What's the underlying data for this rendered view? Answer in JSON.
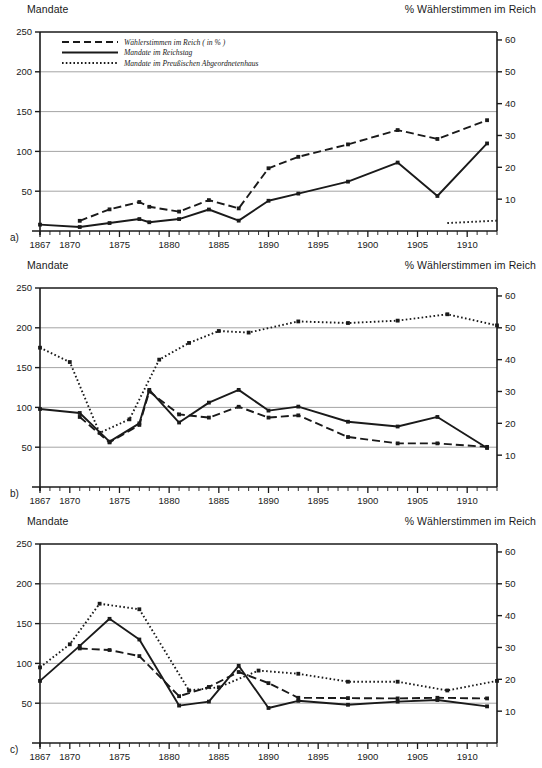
{
  "figure": {
    "axis_title_left": "Mandate",
    "axis_title_right": "% Wählerstimmen im Reich",
    "percent_symbol": "%",
    "panel_labels": [
      "a)",
      "b)",
      "c)"
    ]
  },
  "legend": {
    "position": "top-left of panel a",
    "items": [
      {
        "label": "Wählerstimmen im Reich ( in % )",
        "style": "dashed",
        "key": "votes"
      },
      {
        "label": "Mandate im Reichstag",
        "style": "solid",
        "key": "reichstag"
      },
      {
        "label": "Mandate im Preußischen Abgeordnetenhaus",
        "style": "dotted",
        "key": "preussen"
      }
    ]
  },
  "axes": {
    "left_ticks": [
      250,
      200,
      150,
      100,
      50
    ],
    "left_label_all": [
      0,
      50,
      100,
      150,
      200,
      250
    ],
    "right_ticks": [
      60,
      50,
      40,
      30,
      20,
      10
    ],
    "x_ticks": [
      1867,
      1870,
      1875,
      1880,
      1885,
      1890,
      1895,
      1900,
      1905,
      1910
    ],
    "x_min": 1867,
    "x_max": 1913,
    "y_left_min": 0,
    "y_left_max": 250,
    "y_right_min": 0,
    "y_right_max": 62.5,
    "grid": "horizontal"
  },
  "chart_data": [
    {
      "type": "line",
      "panel": "a)",
      "title": "Mandate",
      "subtitle": "% Wählerstimmen im Reich",
      "xlabel": "",
      "ylabel": "Mandate",
      "ylabel_right": "% Wählerstimmen im Reich",
      "xlim": [
        1867,
        1913
      ],
      "ylim": [
        0,
        250
      ],
      "ylim_right": [
        0,
        62.5
      ],
      "grid": true,
      "legend": "top-left",
      "series": [
        {
          "name": "Wählerstimmen im Reich ( in % )",
          "style": "dashed",
          "axis": "right",
          "x": [
            1871,
            1874,
            1877,
            1878,
            1881,
            1884,
            1887,
            1890,
            1893,
            1898,
            1903,
            1907,
            1912
          ],
          "values": [
            3.2,
            6.8,
            9.1,
            7.6,
            6.1,
            9.7,
            7.1,
            19.7,
            23.3,
            27.2,
            31.7,
            28.9,
            34.8
          ]
        },
        {
          "name": "Mandate im Reichstag",
          "style": "solid",
          "axis": "left",
          "x": [
            1867,
            1871,
            1874,
            1877,
            1878,
            1881,
            1884,
            1887,
            1890,
            1893,
            1898,
            1903,
            1907,
            1912
          ],
          "values": [
            8,
            5,
            10,
            15,
            11,
            15,
            27,
            13,
            38,
            47,
            62,
            86,
            44,
            110
          ]
        },
        {
          "name": "Mandate im Preußischen Abgeordnetenhaus",
          "style": "dotted",
          "axis": "left",
          "x": [
            1908,
            1913
          ],
          "values": [
            10,
            13
          ]
        }
      ]
    },
    {
      "type": "line",
      "panel": "b)",
      "title": "Mandate",
      "subtitle": "% Wählerstimmen im Reich",
      "xlabel": "",
      "ylabel": "Mandate",
      "ylabel_right": "% Wählerstimmen im Reich",
      "xlim": [
        1867,
        1913
      ],
      "ylim": [
        0,
        250
      ],
      "ylim_right": [
        0,
        62.5
      ],
      "grid": true,
      "series": [
        {
          "name": "Wählerstimmen im Reich ( in % )",
          "style": "dashed",
          "axis": "right",
          "x": [
            1871,
            1874,
            1877,
            1878,
            1881,
            1884,
            1887,
            1890,
            1893,
            1898,
            1903,
            1907,
            1912
          ],
          "values": [
            22.0,
            14.0,
            19.5,
            30.0,
            22.8,
            21.8,
            25.2,
            21.8,
            22.5,
            15.7,
            13.7,
            13.7,
            12.6
          ]
        },
        {
          "name": "Mandate im Reichstag",
          "style": "solid",
          "axis": "left",
          "x": [
            1867,
            1871,
            1874,
            1877,
            1878,
            1881,
            1884,
            1887,
            1890,
            1893,
            1898,
            1903,
            1907,
            1912
          ],
          "values": [
            98,
            93,
            57,
            80,
            122,
            81,
            106,
            122,
            96,
            101,
            82,
            76,
            88,
            49
          ]
        },
        {
          "name": "Mandate im Preußischen Abgeordnetenhaus",
          "style": "dotted",
          "axis": "left",
          "x": [
            1867,
            1870,
            1873,
            1876,
            1879,
            1882,
            1885,
            1888,
            1893,
            1898,
            1903,
            1908,
            1913
          ],
          "values": [
            175,
            157,
            68,
            85,
            160,
            181,
            196,
            194,
            208,
            206,
            209,
            217,
            203
          ]
        }
      ]
    },
    {
      "type": "line",
      "panel": "c)",
      "title": "Mandate",
      "subtitle": "% Wählerstimmen im Reich",
      "xlabel": "",
      "ylabel": "Mandate",
      "ylabel_right": "% Wählerstimmen im Reich",
      "xlim": [
        1867,
        1913
      ],
      "ylim": [
        0,
        250
      ],
      "ylim_right": [
        0,
        62.5
      ],
      "grid": true,
      "series": [
        {
          "name": "Wählerstimmen im Reich ( in % )",
          "style": "dashed",
          "axis": "right",
          "x": [
            1871,
            1874,
            1877,
            1881,
            1884,
            1887,
            1890,
            1893,
            1898,
            1903,
            1907,
            1912
          ],
          "values": [
            29.7,
            29.2,
            27.3,
            14.7,
            17.6,
            22.3,
            18.8,
            14.2,
            14.1,
            14.0,
            14.2,
            14.0
          ]
        },
        {
          "name": "Mandate im Reichstag",
          "style": "solid",
          "axis": "left",
          "x": [
            1867,
            1871,
            1874,
            1877,
            1881,
            1884,
            1887,
            1890,
            1893,
            1898,
            1903,
            1907,
            1912
          ],
          "values": [
            78,
            122,
            156,
            130,
            47,
            52,
            97,
            44,
            53,
            48,
            52,
            54,
            46
          ]
        },
        {
          "name": "Mandate im Preußischen Abgeordnetenhaus",
          "style": "dotted",
          "axis": "left",
          "x": [
            1867,
            1870,
            1873,
            1877,
            1882,
            1885,
            1889,
            1893,
            1898,
            1903,
            1908,
            1913
          ],
          "values": [
            95,
            124,
            175,
            168,
            66,
            70,
            91,
            87,
            77,
            77,
            66,
            78
          ]
        }
      ]
    }
  ],
  "colors": {
    "ink": "#1a1a1a",
    "grid": "#9a9a9a",
    "background": "#ffffff"
  }
}
